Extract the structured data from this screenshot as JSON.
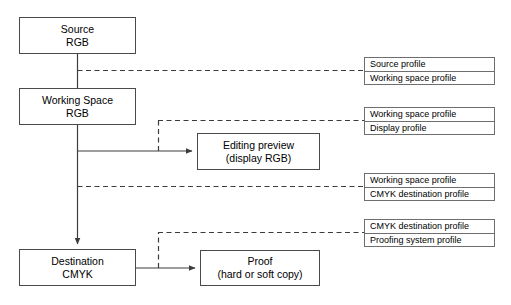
{
  "diagram": {
    "line_color": "#3c3c3c",
    "box_border_color": "#4a4a4a",
    "table_border_color": "#6e6e6e",
    "background": "#ffffff",
    "nodes": [
      {
        "id": "source",
        "line1": "Source",
        "line2": "RGB"
      },
      {
        "id": "working-space",
        "line1": "Working Space",
        "line2": "RGB"
      },
      {
        "id": "editing-preview",
        "line1": "Editing preview",
        "line2": "(display RGB)"
      },
      {
        "id": "destination",
        "line1": "Destination",
        "line2": "CMYK"
      },
      {
        "id": "proof",
        "line1": "Proof",
        "line2": "(hard or soft copy)"
      }
    ],
    "profile_tables": [
      {
        "id": "profiles-source-to-working",
        "rows": [
          "Source profile",
          "Working space profile"
        ]
      },
      {
        "id": "profiles-working-to-display",
        "rows": [
          "Working space profile",
          "Display profile"
        ]
      },
      {
        "id": "profiles-working-to-cmyk",
        "rows": [
          "Working space profile",
          "CMYK destination profile"
        ]
      },
      {
        "id": "profiles-cmyk-to-proof",
        "rows": [
          "CMYK destination profile",
          "Proofing system profile"
        ]
      }
    ]
  }
}
